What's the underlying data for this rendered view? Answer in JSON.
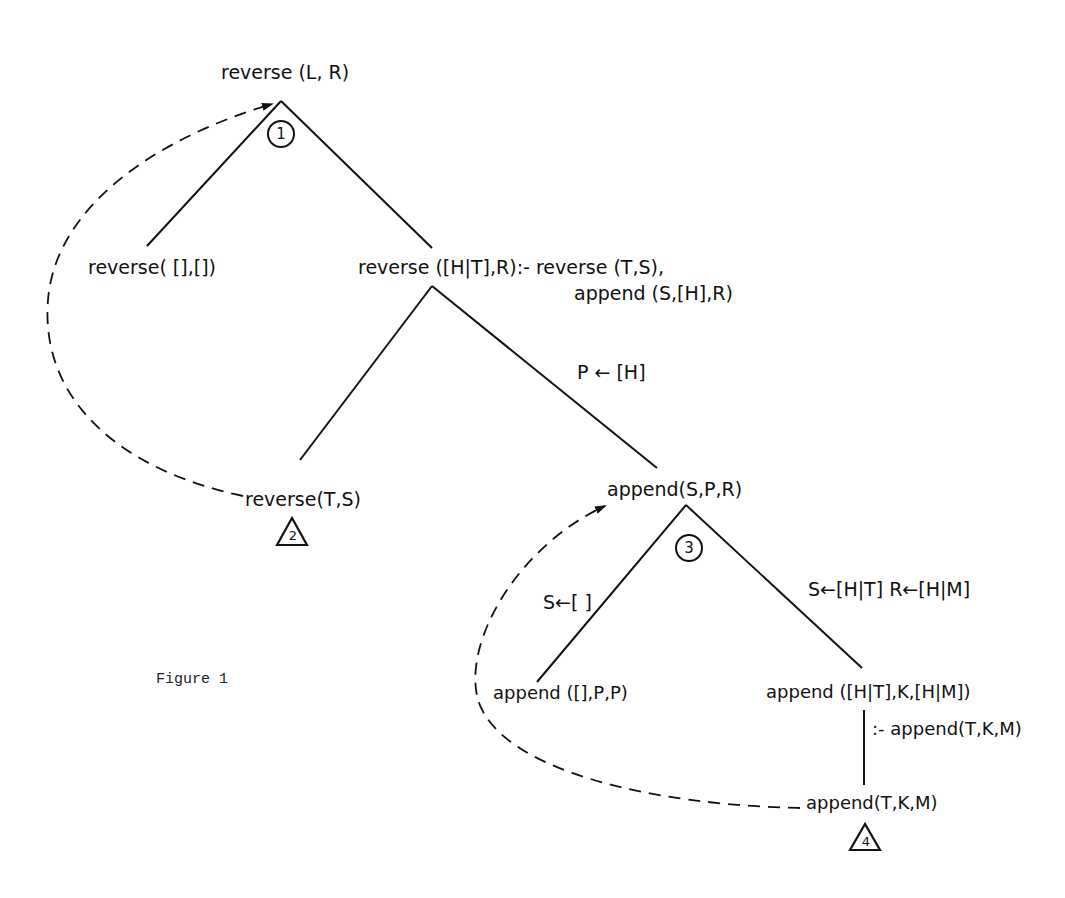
{
  "figure": {
    "caption": "Figure 1"
  },
  "nodes": {
    "root": "reverse (L, R)",
    "rev_base": "reverse( [],[])",
    "rev_rec_head": "reverse ([H|T],R):- reverse (T,S),",
    "rev_rec_body": "append (S,[H],R)",
    "rev_call": "reverse(T,S)",
    "app_call": "append(S,P,R)",
    "app_base": "append ([],P,P)",
    "app_rec_head": "append ([H|T],K,[H|M])",
    "app_rec_body": ":- append(T,K,M)",
    "app_recursive_call": "append(T,K,M)"
  },
  "edge_labels": {
    "p_binding": "P ← [H]",
    "s_empty": "S←[ ]",
    "s_r_binding": "S←[H|T]  R←[H|M]"
  },
  "markers": {
    "circle_1": "1",
    "triangle_2": "2",
    "circle_3": "3",
    "triangle_4": "4"
  },
  "colors": {
    "ink": "#111111",
    "background": "#ffffff"
  }
}
